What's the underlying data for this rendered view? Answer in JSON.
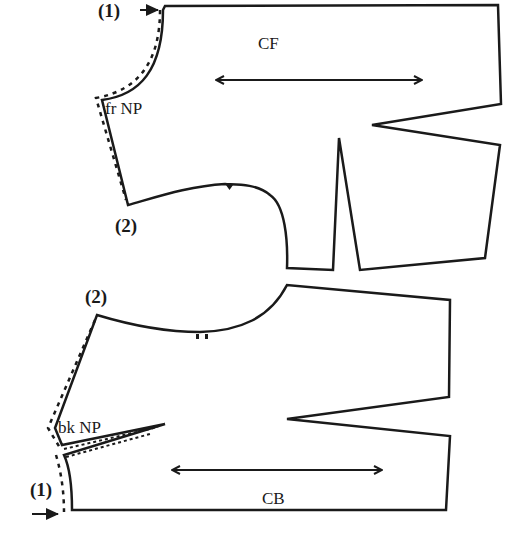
{
  "diagram": {
    "type": "sewing-pattern-bodice",
    "colors": {
      "line": "#1a1a1a",
      "background": "#ffffff"
    },
    "front_piece": {
      "center_label": "CF",
      "neck_label": "fr NP",
      "point_1_label": "(1)",
      "point_2_label": "(2)"
    },
    "back_piece": {
      "center_label": "CB",
      "neck_label": "bk NP",
      "point_1_label": "(1)",
      "point_2_label": "(2)"
    }
  }
}
